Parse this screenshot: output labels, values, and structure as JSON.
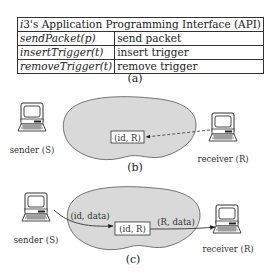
{
  "api_table": {
    "title_prefix_italic": "i",
    "title": "3's Application Programming Interface (API)",
    "rows": [
      {
        "function": "sendPacket(p)",
        "description": "send packet"
      },
      {
        "function": "insertTrigger(t)",
        "description": "insert trigger"
      },
      {
        "function": "removeTrigger(t)",
        "description": "remove trigger"
      }
    ]
  },
  "captions": {
    "a": "(a)",
    "b": "(b)",
    "c": "(c)"
  },
  "panel_b": {
    "sender_label": "sender (S)",
    "receiver_label": "receiver (R)",
    "trigger_box": "(id, R)"
  },
  "panel_c": {
    "sender_label": "sender (S)",
    "receiver_label": "receiver (R)",
    "trigger_box": "(id, R)",
    "sender_packet": "(id, data)",
    "forwarded_packet": "(R, data)"
  },
  "colors": {
    "cloud": "#d9d9d9",
    "ink": "#333333"
  }
}
